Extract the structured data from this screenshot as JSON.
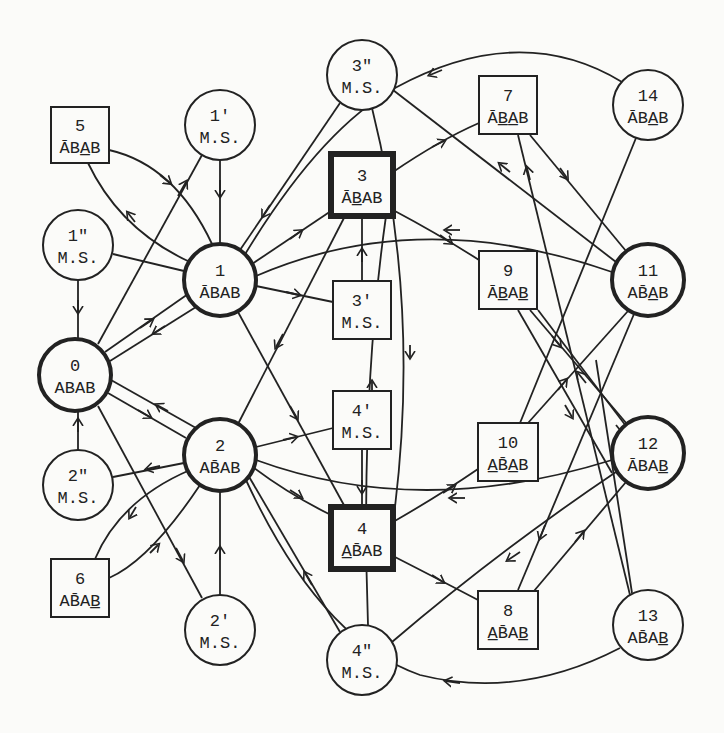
{
  "diagram": {
    "type": "state-transition-graph",
    "colors": {
      "ink": "#222222",
      "paper": "#fbfbf9"
    },
    "nodes": [
      {
        "id": "0",
        "shape": "circle",
        "bold": true,
        "line1": "0",
        "line2": "ABAB",
        "overbar": "",
        "underbar": "",
        "x": 75,
        "y": 375,
        "r": 36
      },
      {
        "id": "1",
        "shape": "circle",
        "bold": true,
        "line1": "1",
        "line2": "ĀBAB",
        "overbar": "A",
        "underbar": "",
        "x": 220,
        "y": 280,
        "r": 36
      },
      {
        "id": "2",
        "shape": "circle",
        "bold": true,
        "line1": "2",
        "line2": "AB̄AB",
        "overbar": "B",
        "underbar": "",
        "x": 220,
        "y": 455,
        "r": 36
      },
      {
        "id": "1p",
        "shape": "circle",
        "bold": false,
        "line1": "1'",
        "line2": "M.S.",
        "x": 220,
        "y": 125,
        "r": 35
      },
      {
        "id": "1pp",
        "shape": "circle",
        "bold": false,
        "line1": "1\"",
        "line2": "M.S.",
        "x": 78,
        "y": 245,
        "r": 35
      },
      {
        "id": "2p",
        "shape": "circle",
        "bold": false,
        "line1": "2'",
        "line2": "M.S.",
        "x": 220,
        "y": 630,
        "r": 35
      },
      {
        "id": "2pp",
        "shape": "circle",
        "bold": false,
        "line1": "2\"",
        "line2": "M.S.",
        "x": 78,
        "y": 485,
        "r": 35
      },
      {
        "id": "3pp",
        "shape": "circle",
        "bold": false,
        "line1": "3\"",
        "line2": "M.S.",
        "x": 362,
        "y": 75,
        "r": 35
      },
      {
        "id": "4pp",
        "shape": "circle",
        "bold": false,
        "line1": "4\"",
        "line2": "M.S.",
        "x": 362,
        "y": 660,
        "r": 35
      },
      {
        "id": "5",
        "shape": "box",
        "bold": false,
        "line1": "5",
        "line2": "ĀBA̲B",
        "x": 80,
        "y": 135,
        "w": 58,
        "h": 56
      },
      {
        "id": "6",
        "shape": "box",
        "bold": false,
        "line1": "6",
        "line2": "AB̄AB̲",
        "x": 80,
        "y": 588,
        "w": 58,
        "h": 58
      },
      {
        "id": "3",
        "shape": "box",
        "bold": true,
        "line1": "3",
        "line2": "ĀB̲AB",
        "x": 362,
        "y": 185,
        "w": 62,
        "h": 62
      },
      {
        "id": "3p",
        "shape": "box",
        "bold": false,
        "line1": "3'",
        "line2": "M.S.",
        "x": 362,
        "y": 310,
        "w": 58,
        "h": 58
      },
      {
        "id": "4p",
        "shape": "box",
        "bold": false,
        "line1": "4'",
        "line2": "M.S.",
        "x": 362,
        "y": 420,
        "w": 58,
        "h": 58
      },
      {
        "id": "4",
        "shape": "box",
        "bold": true,
        "line1": "4",
        "line2": "A̲B̄AB",
        "x": 362,
        "y": 538,
        "w": 62,
        "h": 62
      },
      {
        "id": "7",
        "shape": "box",
        "bold": false,
        "line1": "7",
        "line2": "ĀB̲A̲B",
        "x": 508,
        "y": 105,
        "w": 58,
        "h": 58
      },
      {
        "id": "9",
        "shape": "box",
        "bold": false,
        "line1": "9",
        "line2": "ĀB̲AB̲",
        "x": 508,
        "y": 280,
        "w": 58,
        "h": 58
      },
      {
        "id": "10",
        "shape": "box",
        "bold": false,
        "line1": "10",
        "line2": "A̲B̄A̲B",
        "x": 508,
        "y": 452,
        "w": 60,
        "h": 58
      },
      {
        "id": "8",
        "shape": "box",
        "bold": false,
        "line1": "8",
        "line2": "A̲B̄AB̲",
        "x": 508,
        "y": 620,
        "w": 60,
        "h": 58
      },
      {
        "id": "14",
        "shape": "circle",
        "bold": false,
        "line1": "14",
        "line2": "ĀBA̲B",
        "x": 648,
        "y": 105,
        "r": 35
      },
      {
        "id": "11",
        "shape": "circle",
        "bold": true,
        "line1": "11",
        "line2": "AB̄A̲B",
        "x": 648,
        "y": 280,
        "r": 36
      },
      {
        "id": "12",
        "shape": "circle",
        "bold": true,
        "line1": "12",
        "line2": "ĀBAB̲",
        "x": 648,
        "y": 453,
        "r": 36
      },
      {
        "id": "13",
        "shape": "circle",
        "bold": false,
        "line1": "13",
        "line2": "AB̄AB̲",
        "x": 648,
        "y": 625,
        "r": 35
      }
    ],
    "edges": [
      {
        "from": "1pp",
        "to": "0",
        "arrow": "down"
      },
      {
        "from": "2pp",
        "to": "0",
        "arrow": "up"
      },
      {
        "from": "1p",
        "to": "1",
        "arrow": "down"
      },
      {
        "from": "0",
        "to": "1p",
        "arrow": "toward-1p"
      },
      {
        "from": "0",
        "to": "1"
      },
      {
        "from": "1",
        "to": "0"
      },
      {
        "from": "0",
        "to": "2"
      },
      {
        "from": "2",
        "to": "0"
      },
      {
        "from": "0",
        "to": "2p"
      },
      {
        "from": "1",
        "to": "1pp"
      },
      {
        "from": "2",
        "to": "2pp"
      },
      {
        "from": "5",
        "to": "1"
      },
      {
        "from": "1",
        "to": "5"
      },
      {
        "from": "6",
        "to": "2"
      },
      {
        "from": "2",
        "to": "6"
      },
      {
        "from": "2p",
        "to": "2"
      },
      {
        "from": "1",
        "to": "3"
      },
      {
        "from": "3pp",
        "to": "1"
      },
      {
        "from": "1",
        "to": "3p"
      },
      {
        "from": "1",
        "to": "4"
      },
      {
        "from": "3p",
        "to": "3"
      },
      {
        "from": "3",
        "to": "2"
      },
      {
        "from": "2",
        "to": "4p"
      },
      {
        "from": "2",
        "to": "4"
      },
      {
        "from": "4p",
        "to": "4"
      },
      {
        "from": "4pp",
        "to": "1"
      },
      {
        "from": "3",
        "to": "7"
      },
      {
        "from": "3",
        "to": "9"
      },
      {
        "from": "4",
        "to": "10"
      },
      {
        "from": "4",
        "to": "8"
      },
      {
        "from": "14",
        "to": "1"
      },
      {
        "from": "11",
        "to": "3pp"
      },
      {
        "from": "11",
        "to": "1"
      },
      {
        "from": "12",
        "to": "2"
      },
      {
        "from": "12",
        "to": "4pp"
      },
      {
        "from": "13",
        "to": "2"
      },
      {
        "from": "3pp",
        "to": "4"
      },
      {
        "from": "4pp",
        "to": "3"
      },
      {
        "from": "7",
        "to": "11"
      },
      {
        "from": "11",
        "to": "7"
      },
      {
        "from": "9",
        "to": "12"
      },
      {
        "from": "12",
        "to": "9"
      },
      {
        "from": "10",
        "to": "11"
      },
      {
        "from": "11",
        "to": "10"
      },
      {
        "from": "8",
        "to": "12"
      },
      {
        "from": "11",
        "to": "8"
      },
      {
        "from": "14",
        "to": "10"
      },
      {
        "from": "7",
        "to": "13"
      }
    ]
  }
}
